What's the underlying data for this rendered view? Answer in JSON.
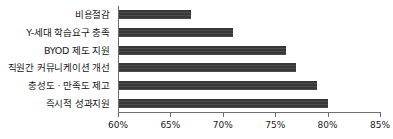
{
  "chart_data": {
    "type": "bar",
    "orientation": "horizontal",
    "title": "",
    "subtitle": "",
    "xlabel": "",
    "ylabel": "",
    "categories": [
      "비용절감",
      "Y-세대 학습요구 충족",
      "BYOD 제도 지원",
      "직원간 커뮤니케이션 개선",
      "충성도 · 만족도 제고",
      "즉시적 성과지원"
    ],
    "values": [
      67,
      71,
      76,
      77,
      79,
      80
    ],
    "value_labels": [
      "67%",
      "71%",
      "76%",
      "77%",
      "79%",
      "80%"
    ],
    "xlim": [
      60,
      85
    ],
    "xticks": [
      60,
      65,
      70,
      75,
      80,
      85
    ],
    "xtick_labels": [
      "60%",
      "65%",
      "70%",
      "75%",
      "80%",
      "85%"
    ],
    "grid": false,
    "legend": null,
    "bar_color": "#383838",
    "axis_color": "#6e6e6e",
    "background_color": "#ffffff"
  }
}
